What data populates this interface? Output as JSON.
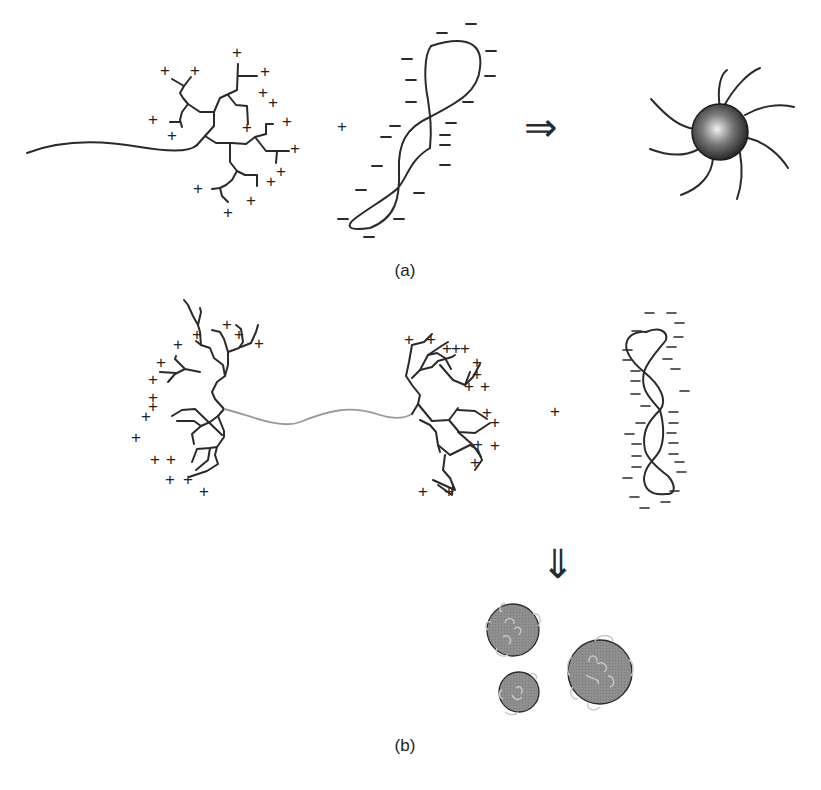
{
  "figure": {
    "panels": [
      {
        "id": "a",
        "label": "(a)",
        "components": {
          "reactant_1": "dendron-wedge-polycation (linear chain + branched dendron with + charges)",
          "operator": "+",
          "reactant_2": "polyanion coil (DNA, with − charges)",
          "arrow": "⇒",
          "product": "spherical micelle / complex core with radiating chains"
        }
      },
      {
        "id": "b",
        "label": "(b)",
        "components": {
          "reactant_1": "dumbbell: two cationic dendrons joined by linear chain",
          "operator": "+",
          "reactant_2": "twisted polyanion (DNA, with − charges)",
          "arrow": "⇓",
          "product": "three compacted spherical particles"
        }
      }
    ],
    "symbols": {
      "plus": "+",
      "minus": "−",
      "arrow_right": "⇒",
      "arrow_down": "⇓"
    },
    "colors": {
      "stroke": "#2a2a2a",
      "linker_gray": "#9a9a9a",
      "particle_fill": "#8e8e8e",
      "sphere_highlight": "#e8e8e8",
      "sphere_dark": "#1e1e1e"
    }
  }
}
